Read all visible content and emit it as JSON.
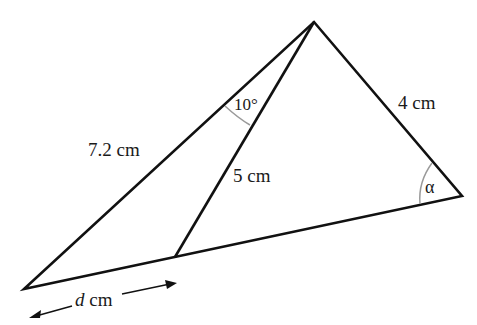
{
  "diagram": {
    "colors": {
      "stroke": "#111111",
      "arc": "#9a9a9a",
      "text": "#1a1a1a",
      "background": "#ffffff"
    },
    "vertices": {
      "apex": [
        314,
        22
      ],
      "right": [
        462,
        196
      ],
      "left": [
        24,
        289
      ],
      "cevian_foot": [
        175,
        257
      ]
    },
    "labels": {
      "left_side": "7.2 cm",
      "right_side": "4 cm",
      "cevian": "5 cm",
      "apex_angle": "10°",
      "right_angle": "α",
      "base_segment_var": "d",
      "base_segment_unit": " cm"
    }
  }
}
